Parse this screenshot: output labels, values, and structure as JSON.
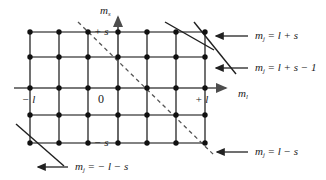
{
  "figure": {
    "background": "#ffffff",
    "line_color": "#4d4d4d",
    "node_color": "#111111",
    "text_color": "#1a1a1a"
  },
  "axes": {
    "vertical": {
      "name": "m_s",
      "label_main": "m",
      "label_sub": "s"
    },
    "horizontal": {
      "name": "m_l",
      "label_main": "m",
      "label_sub": "l"
    }
  },
  "ticks": {
    "x_left": "− l",
    "x_origin": "0",
    "x_right": "+ l",
    "y_top": "+ s",
    "y_bottom": "− s"
  },
  "grid": {
    "columns": 7,
    "rows": 5,
    "x_positions": [
      30,
      59,
      88,
      118,
      147,
      176,
      205
    ],
    "y_positions": [
      32,
      57,
      88,
      115,
      143
    ],
    "node_radius": 2.6
  },
  "callouts": [
    {
      "id": "mj-top",
      "text": "m_j = l + s",
      "main": "m",
      "sub": "j",
      "rhs": " = l + s",
      "arrow_from": [
        249,
        36
      ],
      "arrow_to": [
        215,
        36
      ]
    },
    {
      "id": "mj-second",
      "text": "m_j = l + s − 1",
      "main": "m",
      "sub": "j",
      "rhs": " = l + s − 1",
      "arrow_from": [
        249,
        68
      ],
      "arrow_to": [
        215,
        68
      ]
    },
    {
      "id": "mj-bottom-right",
      "text": "m_j = l − s",
      "main": "m",
      "sub": "j",
      "rhs": " = l − s",
      "arrow_from": [
        249,
        152
      ],
      "arrow_to": [
        216,
        152
      ]
    },
    {
      "id": "mj-bottom-left",
      "text": "m_j = −l − s",
      "main": "m",
      "sub": "j",
      "rhs": " = − l − s",
      "arrow_from": [
        67,
        167
      ],
      "arrow_to": [
        37,
        167
      ]
    }
  ],
  "diagonals": {
    "solid": [
      {
        "id": "diag-top",
        "x1": 165,
        "y1": 22,
        "x2": 212,
        "y2": 48
      },
      {
        "id": "diag-second",
        "x1": 194,
        "y1": 22,
        "x2": 233,
        "y2": 72
      },
      {
        "id": "diag-bottom-left",
        "x1": 16,
        "y1": 124,
        "x2": 63,
        "y2": 165
      }
    ],
    "dashed": [
      {
        "id": "diag-dashed-main",
        "x1": 78,
        "y1": 22,
        "x2": 214,
        "y2": 155
      }
    ]
  }
}
